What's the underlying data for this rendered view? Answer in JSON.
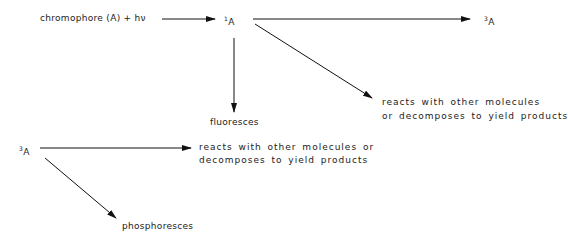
{
  "diagram": {
    "nodes": {
      "start": "chromophore  (A) + hν",
      "singlet": {
        "sup": "1",
        "label": "A"
      },
      "triplet_top": {
        "sup": "3",
        "label": "A"
      },
      "fluoresces": "fluoresces",
      "singlet_reacts_line1": "reacts with other molecules",
      "singlet_reacts_line2": "or decomposes to yield products",
      "triplet_left": {
        "sup": "3",
        "label": "A"
      },
      "triplet_reacts_line1": "reacts with other molecules or",
      "triplet_reacts_line2": "decomposes to  yield products",
      "phosphoresces": "phosphoresces"
    },
    "edges": [
      {
        "from": "start",
        "to": "singlet"
      },
      {
        "from": "singlet",
        "to": "triplet_top"
      },
      {
        "from": "singlet",
        "to": "fluoresces"
      },
      {
        "from": "singlet",
        "to": "singlet_reacts"
      },
      {
        "from": "triplet_left",
        "to": "triplet_reacts"
      },
      {
        "from": "triplet_left",
        "to": "phosphoresces"
      }
    ],
    "colors": {
      "line": "#111111",
      "text": "#222222"
    }
  }
}
